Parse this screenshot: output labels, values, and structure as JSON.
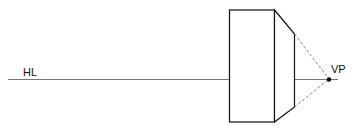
{
  "diagram": {
    "labels": {
      "horizon_line": "HL",
      "vanishing_point": "VP"
    },
    "colors": {
      "line": "#111111",
      "horizon": "#555555",
      "dashed": "#666666"
    },
    "elements": [
      {
        "type": "horizon-line",
        "label": "HL",
        "y": 79
      },
      {
        "type": "front-face-rectangle",
        "x": 229,
        "y": 10,
        "width": 45,
        "height": 112
      },
      {
        "type": "receding-side-face",
        "from_x": 274,
        "to_x": 294
      },
      {
        "type": "convergence-lines-dashed",
        "to": "VP"
      },
      {
        "type": "vanishing-point",
        "label": "VP",
        "x": 329,
        "y": 79
      }
    ]
  }
}
